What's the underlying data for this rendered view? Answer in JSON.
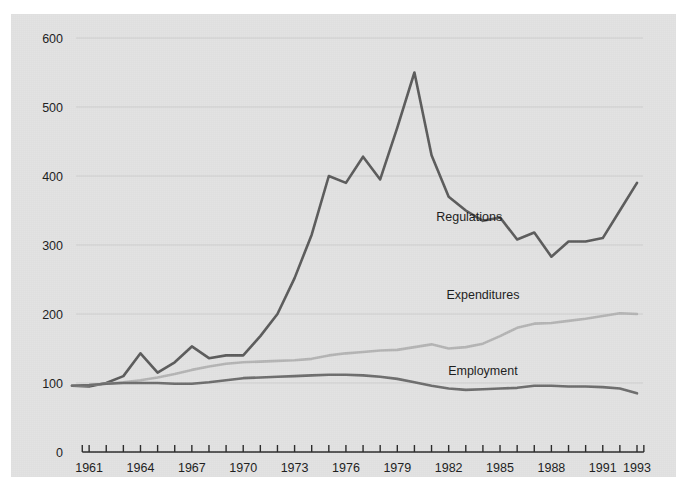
{
  "figure": {
    "background_color": "#e3e3e3",
    "page_background_color": "#ffffff",
    "caption_top": "",
    "caption_bottom": ""
  },
  "chart_data": {
    "type": "line",
    "title": "",
    "subtitle": "",
    "xlabel": "",
    "ylabel": "",
    "xlim": [
      1960,
      1993
    ],
    "ylim": [
      0,
      600
    ],
    "ytick_labels": [
      "600",
      "500",
      "400",
      "300",
      "200",
      "100",
      "0"
    ],
    "ytick_values": [
      600,
      500,
      400,
      300,
      200,
      100,
      0
    ],
    "xtick_labels": [
      "1961",
      "1964",
      "1967",
      "1970",
      "1973",
      "1976",
      "1979",
      "1982",
      "1985",
      "1988",
      "1991",
      "1993"
    ],
    "xtick_values": [
      1961,
      1964,
      1967,
      1970,
      1973,
      1976,
      1979,
      1982,
      1985,
      1988,
      1991,
      1993
    ],
    "x_minor_ticks_every_years": 1,
    "grid": true,
    "grid_axis": "y",
    "grid_color": "#cfcfcf",
    "legend_position": "inline-annotation",
    "x": [
      1960,
      1961,
      1962,
      1963,
      1964,
      1965,
      1966,
      1967,
      1968,
      1969,
      1970,
      1971,
      1972,
      1973,
      1974,
      1975,
      1976,
      1977,
      1978,
      1979,
      1980,
      1981,
      1982,
      1983,
      1984,
      1985,
      1986,
      1987,
      1988,
      1989,
      1990,
      1991,
      1992,
      1993
    ],
    "series": [
      {
        "name": "Regulations",
        "color": "#5c5c5c",
        "stroke_width": 2.6,
        "label_x": 1983.2,
        "label_y": 335,
        "values": [
          96,
          95,
          100,
          110,
          143,
          115,
          130,
          153,
          136,
          140,
          140,
          168,
          200,
          252,
          315,
          400,
          390,
          428,
          395,
          470,
          550,
          430,
          370,
          350,
          335,
          340,
          308,
          318,
          283,
          305,
          305,
          310,
          350,
          390
        ]
      },
      {
        "name": "Expenditures",
        "color": "#b5b5b5",
        "stroke_width": 2.6,
        "label_x": 1984.0,
        "label_y": 222,
        "values": [
          96,
          97,
          99,
          101,
          104,
          108,
          113,
          119,
          124,
          128,
          130,
          131,
          132,
          133,
          135,
          140,
          143,
          145,
          147,
          148,
          152,
          156,
          150,
          152,
          157,
          168,
          180,
          186,
          187,
          190,
          193,
          197,
          201,
          200
        ]
      },
      {
        "name": "Employment",
        "color": "#6e6e6e",
        "stroke_width": 2.6,
        "label_x": 1984.0,
        "label_y": 112,
        "values": [
          96,
          97,
          99,
          100,
          100,
          100,
          99,
          99,
          101,
          104,
          107,
          108,
          109,
          110,
          111,
          112,
          112,
          111,
          109,
          106,
          101,
          96,
          92,
          90,
          91,
          92,
          93,
          96,
          96,
          95,
          95,
          94,
          92,
          85
        ]
      }
    ]
  }
}
